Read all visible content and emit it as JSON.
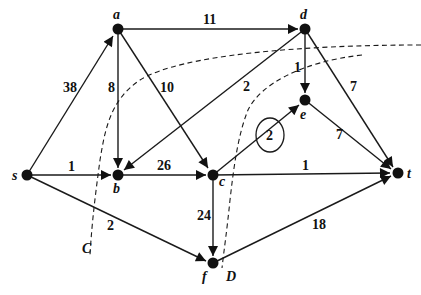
{
  "diagram": {
    "type": "flow-network",
    "nodes": [
      {
        "id": "a",
        "label": "a",
        "x": 118,
        "y": 29
      },
      {
        "id": "d",
        "label": "d",
        "x": 305,
        "y": 29
      },
      {
        "id": "e",
        "label": "e",
        "x": 305,
        "y": 100
      },
      {
        "id": "s",
        "label": "s",
        "x": 27,
        "y": 175
      },
      {
        "id": "b",
        "label": "b",
        "x": 118,
        "y": 175
      },
      {
        "id": "c",
        "label": "c",
        "x": 213,
        "y": 175
      },
      {
        "id": "t",
        "label": "t",
        "x": 398,
        "y": 173
      },
      {
        "id": "f",
        "label": "f",
        "x": 213,
        "y": 263
      }
    ],
    "edges": [
      {
        "from": "s",
        "to": "a",
        "weight": "38"
      },
      {
        "from": "a",
        "to": "d",
        "weight": "11"
      },
      {
        "from": "a",
        "to": "b",
        "weight": "8"
      },
      {
        "from": "a",
        "to": "c",
        "weight": "10"
      },
      {
        "from": "d",
        "to": "b",
        "weight": "2"
      },
      {
        "from": "d",
        "to": "e",
        "weight": "1"
      },
      {
        "from": "d",
        "to": "t",
        "weight": "7"
      },
      {
        "from": "e",
        "to": "t",
        "weight": "7"
      },
      {
        "from": "s",
        "to": "b",
        "weight": "1"
      },
      {
        "from": "b",
        "to": "c",
        "weight": "26"
      },
      {
        "from": "c",
        "to": "e",
        "weight": "2",
        "circled": true
      },
      {
        "from": "c",
        "to": "t",
        "weight": "1"
      },
      {
        "from": "c",
        "to": "f",
        "weight": "24"
      },
      {
        "from": "s",
        "to": "f",
        "weight": "2"
      },
      {
        "from": "f",
        "to": "t",
        "weight": "18"
      }
    ],
    "cuts": [
      {
        "label": "C"
      },
      {
        "label": "D"
      }
    ]
  }
}
